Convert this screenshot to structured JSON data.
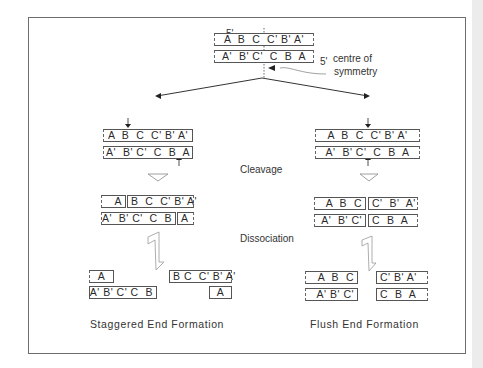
{
  "figure": {
    "top_duplex": {
      "five_prime_top": "5'",
      "five_prime_bottom": "5'",
      "top_strand": "A  B  C  C' B' A'",
      "bottom_strand": "A'  B' C'  C  B  A",
      "symmetry_label_line1": "centre of",
      "symmetry_label_line2": "symmetry"
    },
    "steps": {
      "cleavage": "Cleavage",
      "dissociation": "Dissociation"
    },
    "staggered": {
      "cleave_top": "A  B  C  C' B' A'",
      "cleave_bottom": "A'  B' C'  C  B  A",
      "cut_top_left": "A",
      "cut_top_right": "B  C  C' B' A'",
      "cut_bottom_left": "A'  B' C'  C  B",
      "cut_bottom_right": "A",
      "frag1_top": "A",
      "frag1_bottom": "A' B' C' C  B",
      "frag2_top": "B C  C' B' A'",
      "frag2_bottom": "A",
      "caption": "Staggered  End  Formation"
    },
    "flush": {
      "cleave_top": "A  B  C  C' B' A'",
      "cleave_bottom": "A'  B' C'  C  B  A",
      "cut_top_left": "A  B  C",
      "cut_top_right": "C'  B'  A'",
      "cut_bottom_left": "A'  B' C'",
      "cut_bottom_right": "C  B  A",
      "frag1_top": "A  B  C",
      "frag1_bottom": "A' B' C'",
      "frag2_top": "C' B' A'",
      "frag2_bottom": "C  B  A",
      "caption": "Flush  End  Formation"
    }
  }
}
